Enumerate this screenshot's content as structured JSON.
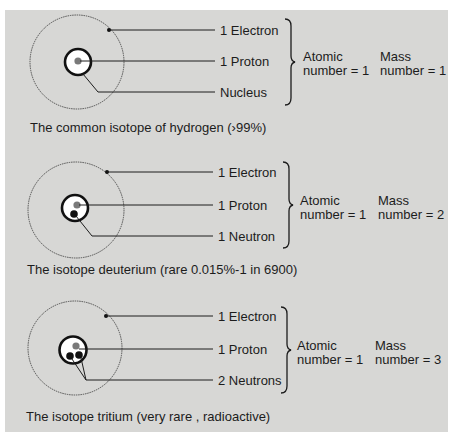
{
  "colors": {
    "background": "#d7d7d5",
    "proton": "#7a7a7a",
    "neutron": "#111111",
    "line": "#1c1c1c"
  },
  "isotopes": [
    {
      "name": "protium",
      "labels": [
        "1 Electron",
        "1 Proton",
        "Nucleus"
      ],
      "atomic": {
        "title": "Atomic",
        "value": "number = 1"
      },
      "mass": {
        "title": "Mass",
        "value": "number = 1"
      },
      "caption": "The common isotope of hydrogen (›99%)",
      "neutrons": 0
    },
    {
      "name": "deuterium",
      "labels": [
        "1 Electron",
        "1 Proton",
        "1 Neutron"
      ],
      "atomic": {
        "title": "Atomic",
        "value": "number = 1"
      },
      "mass": {
        "title": "Mass",
        "value": "number = 2"
      },
      "caption": "The isotope deuterium (rare 0.015%-1 in 6900)",
      "neutrons": 1
    },
    {
      "name": "tritium",
      "labels": [
        "1 Electron",
        "1 Proton",
        "2 Neutrons"
      ],
      "atomic": {
        "title": "Atomic",
        "value": "number = 1"
      },
      "mass": {
        "title": "Mass",
        "value": "number = 3"
      },
      "caption": "The isotope tritium (very rare , radioactive)",
      "neutrons": 2
    }
  ]
}
